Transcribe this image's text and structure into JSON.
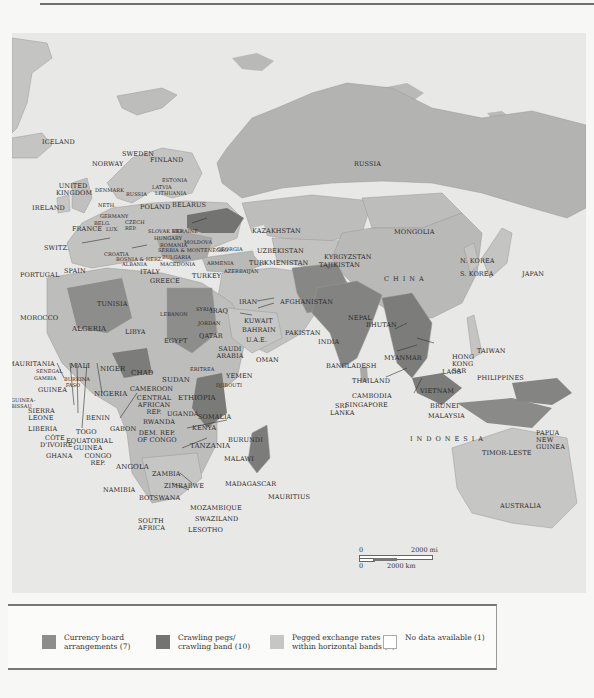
{
  "colors": {
    "ocean": "#e8e8e6",
    "land_default": "#b9b9b7",
    "currency_board": "#8d8d8b",
    "crawling_peg": "#737371",
    "horizontal_band": "#c6c6c4",
    "no_data": "#ffffff"
  },
  "map": {
    "labels": {
      "iceland": "ICELAND",
      "norway": "NORWAY",
      "sweden": "SWEDEN",
      "finland": "FINLAND",
      "russia": "RUSSIA",
      "estonia": "ESTONIA",
      "latvia": "LATVIA",
      "lithuania": "LITHUANIA",
      "russia_small": "RUSSIA",
      "denmark": "DENMARK",
      "united_kingdom": "UNITED KINGDOM",
      "ireland": "IRELAND",
      "neth": "NETH.",
      "germany": "GERMANY",
      "belg": "BELG.",
      "lux": "LUX.",
      "poland": "POLAND",
      "belarus": "BELARUS",
      "czech_rep": "CZECH REP.",
      "slovak_rep": "SLOVAK REP.",
      "ukraine": "UKRAINE",
      "hungary": "HUNGARY",
      "moldova": "MOLDOVA",
      "romania": "ROMANIA",
      "france": "FRANCE",
      "switz": "SWITZ.",
      "croatia": "CROATIA",
      "bosnia": "BOSNIA & HERZ.",
      "serbia_montenegro": "SERBIA & MONTENEGRO",
      "bulgaria": "BULGARIA",
      "albania": "ALBANIA",
      "macedonia": "MACEDONIA",
      "italy": "ITALY",
      "greece": "GREECE",
      "georgia": "GEORGIA",
      "armenia": "ARMENIA",
      "azerbaijan": "AZERBAIJAN",
      "turkey": "TURKEY",
      "portugal": "PORTUGAL",
      "spain": "SPAIN",
      "kazakhstan": "KAZAKHSTAN",
      "mongolia": "MONGOLIA",
      "uzbekistan": "UZBEKISTAN",
      "kyrgyzstan": "KYRGYZSTAN",
      "turkmenistan": "TURKMENISTAN",
      "tajikistan": "TAJIKISTAN",
      "n_korea": "N. KOREA",
      "s_korea": "S. KOREA",
      "japan": "JAPAN",
      "china": "CHINA",
      "tunisia": "TUNISIA",
      "syria": "SYRIA",
      "lebanon": "LEBANON",
      "iraq": "IRAQ",
      "iran": "IRAN",
      "afghanistan": "AFGHANISTAN",
      "jordan": "JORDAN",
      "kuwait": "KUWAIT",
      "bahrain": "BAHRAIN",
      "qatar": "QATAR",
      "uae": "U.A.E.",
      "pakistan": "PAKISTAN",
      "nepal": "NEPAL",
      "bhutan": "BHUTAN",
      "india": "INDIA",
      "morocco": "MOROCCO",
      "algeria": "ALGERIA",
      "libya": "LIBYA",
      "egypt": "EGYPT",
      "saudi_arabia": "SAUDI ARABIA",
      "oman": "OMAN",
      "yemen": "YEMEN",
      "bangladesh": "BANGLADESH",
      "myanmar": "MYANMAR",
      "laos": "LAOS",
      "hong_kong": "HONG KONG SAR",
      "taiwan": "TAIWAN",
      "philippines": "PHILIPPINES",
      "thailand": "THAILAND",
      "vietnam": "VIETNAM",
      "cambodia": "CAMBODIA",
      "mauritania": "MAURITANIA",
      "senegal": "SENEGAL",
      "gambia": "GAMBIA",
      "mali": "MALI",
      "niger": "NIGER",
      "chad": "CHAD",
      "sudan": "SUDAN",
      "eritrea": "ERITREA",
      "djibouti": "DJIBOUTI",
      "burkina_faso": "BURKINA FASO",
      "guinea": "GUINEA",
      "guinea_bissau": "GUINEA-BISSAU",
      "nigeria": "NIGERIA",
      "cameroon": "CAMEROON",
      "ethiopia": "ETHIOPIA",
      "somalia": "SOMALIA",
      "sri_lanka": "SRI LANKA",
      "brunei": "BRUNEI",
      "malaysia": "MALAYSIA",
      "sierra_leone": "SIERRA LEONE",
      "liberia": "LIBERIA",
      "cote_divoire": "CÔTE D'IVOIRE",
      "ghana": "GHANA",
      "togo": "TOGO",
      "benin": "BENIN",
      "equatorial_guinea": "EQUATORIAL GUINEA",
      "gabon": "GABON",
      "congo_rep": "CONGO REP.",
      "central_african_rep": "CENTRAL AFRICAN REP.",
      "dem_rep_congo": "DEM. REP. OF CONGO",
      "uganda": "UGANDA",
      "rwanda": "RWANDA",
      "kenya": "KENYA",
      "burundi": "BURUNDI",
      "tanzania": "TANZANIA",
      "singapore": "SINGAPORE",
      "indonesia": "INDONESIA",
      "papua_new_guinea": "PAPUA NEW GUINEA",
      "timor_leste": "TIMOR-LESTE",
      "angola": "ANGOLA",
      "zambia": "ZAMBIA",
      "malawi": "MALAWI",
      "madagascar": "MADAGASCAR",
      "mauritius": "MAURITIUS",
      "namibia": "NAMIBIA",
      "zimbabwe": "ZIMBABWE",
      "botswana": "BOTSWANA",
      "mozambique": "MOZAMBIQUE",
      "swaziland": "SWAZILAND",
      "south_africa": "SOUTH AFRICA",
      "lesotho": "LESOTHO",
      "australia": "AUSTRALIA"
    },
    "scale": {
      "zero_top": "0",
      "zero_bottom": "0",
      "miles": "2000 mi",
      "km": "2000 km"
    }
  },
  "legend": {
    "items": [
      {
        "label_line1": "Currency board",
        "label_line2": "arrangements (7)",
        "swatch": "currency_board"
      },
      {
        "label_line1": "Crawling pegs/",
        "label_line2": "crawling band (10)",
        "swatch": "crawling_peg"
      },
      {
        "label_line1": "Pegged exchange rates",
        "label_line2": "within horizontal bands (3)",
        "swatch": "horizontal_band"
      },
      {
        "label_line1": "No data available (1)",
        "label_line2": "",
        "swatch": "no_data"
      }
    ]
  }
}
